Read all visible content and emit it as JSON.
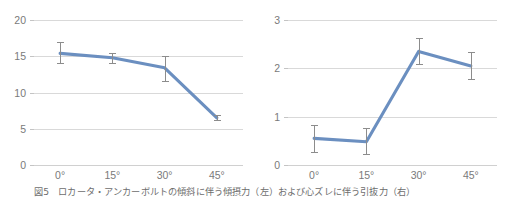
{
  "figure": {
    "caption": "図5　ロカータ・アンカーボルトの傾斜に伴う傾摂力（左）および心ズレに伴う引抜力（右）"
  },
  "style": {
    "line_color": "#6b8fc0",
    "gridline_color": "#d9d9d9",
    "errorbar_color": "#8c8c8c",
    "tick_label_color": "#7a7a7a",
    "background": "#ffffff"
  },
  "chart_data": [
    {
      "type": "line",
      "id": "left",
      "title": "",
      "xlabel": "",
      "ylabel": "",
      "categories": [
        "0°",
        "15°",
        "30°",
        "45°"
      ],
      "values": [
        15.4,
        14.8,
        13.4,
        6.5
      ],
      "error_low": [
        14.1,
        14.1,
        11.6,
        6.2
      ],
      "error_high": [
        16.9,
        15.5,
        15.0,
        6.9
      ],
      "ylim": [
        0,
        20
      ],
      "yticks": [
        0,
        5,
        10,
        15,
        20
      ],
      "ytick_labels": [
        "0",
        "5",
        "10",
        "15",
        "20"
      ],
      "grid": true,
      "legend": "none"
    },
    {
      "type": "line",
      "id": "right",
      "title": "",
      "xlabel": "",
      "ylabel": "",
      "categories": [
        "0°",
        "15°",
        "30°",
        "45°"
      ],
      "values": [
        0.55,
        0.48,
        2.35,
        2.05
      ],
      "error_low": [
        0.27,
        0.22,
        2.08,
        1.78
      ],
      "error_high": [
        0.83,
        0.77,
        2.62,
        2.33
      ],
      "ylim": [
        0,
        3
      ],
      "yticks": [
        0,
        1,
        2,
        3
      ],
      "ytick_labels": [
        "0",
        "1",
        "2",
        "3"
      ],
      "grid": true,
      "legend": "none"
    }
  ]
}
